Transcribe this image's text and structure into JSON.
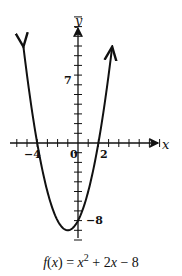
{
  "chart_data": {
    "type": "line",
    "title": "",
    "function": "x^2 + 2x - 8",
    "caption": "f(x) = x² + 2x − 8",
    "xlabel": "x",
    "ylabel": "y",
    "xlim": [
      -6,
      8
    ],
    "ylim": [
      -10,
      13
    ],
    "x_tick_step": 1,
    "y_tick_step": 1,
    "labeled_x_ticks": [
      "-4",
      "0",
      "2"
    ],
    "labeled_y_ticks": [
      "7",
      "-8"
    ],
    "x": [
      -5.2,
      -5,
      -4,
      -3,
      -2,
      -1,
      0,
      1,
      2,
      3,
      3.2
    ],
    "y": [
      8.64,
      7,
      0,
      -5,
      -8,
      -9,
      -8,
      -5,
      0,
      7,
      8.64
    ],
    "vertex": [
      -1,
      -9
    ],
    "x_intercepts": [
      -4,
      2
    ],
    "y_intercept": -8,
    "grid": false,
    "arrows_on_curve_ends": true
  },
  "labels": {
    "x_axis": "x",
    "y_axis": "y",
    "tick_neg4": "−4",
    "tick_0": "0",
    "tick_2": "2",
    "tick_7": "7",
    "tick_neg8": "−8"
  },
  "caption": {
    "f": "f",
    "lhs_rest": "(",
    "x1": "x",
    "rp": ") = ",
    "x2": "x",
    "exp": "2",
    "tail": " + 2",
    "x3": "x",
    "end": " − 8"
  },
  "colors": {
    "ink": "#111111",
    "background": "#ffffff"
  }
}
